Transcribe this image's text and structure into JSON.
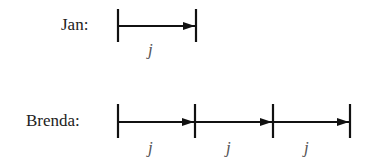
{
  "rows": [
    {
      "name": "Jan:",
      "segments": [
        {
          "label": "j"
        }
      ]
    },
    {
      "name": "Brenda:",
      "segments": [
        {
          "label": "j"
        },
        {
          "label": "j"
        },
        {
          "label": "j"
        }
      ]
    }
  ],
  "colors": {
    "line": "#111111",
    "text": "#222222",
    "var": "#555555"
  }
}
